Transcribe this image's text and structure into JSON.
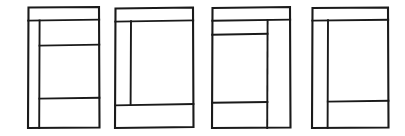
{
  "figure": {
    "title": "",
    "caption": "",
    "background_color": "#ffffff",
    "line_color": "#1a1a1a",
    "width": 405,
    "height": 136,
    "panel_count": 4
  },
  "panels": [
    {
      "id": "panel-1",
      "label": "",
      "x": 23,
      "width": 78,
      "outer": {
        "x": 4,
        "y": 7,
        "w": 72,
        "h": 121
      },
      "top_strip": {
        "y": 20,
        "label": "header-strip"
      },
      "vertical_dividers": [
        {
          "x": 16,
          "from_y": 20,
          "to_y": 128,
          "label": "left-column-divider"
        }
      ],
      "horizontal_dividers": [
        {
          "y": 45,
          "from_x": 16,
          "to_x": 76,
          "label": "right-column-line-1"
        },
        {
          "y": 98,
          "from_x": 16,
          "to_x": 76,
          "label": "right-column-line-2"
        }
      ],
      "region_count": 5
    },
    {
      "id": "panel-2",
      "label": "",
      "x": 108,
      "width": 92,
      "outer": {
        "x": 6,
        "y": 7,
        "w": 78,
        "h": 121
      },
      "top_strip": {
        "y": 21,
        "label": "header-strip"
      },
      "vertical_dividers": [
        {
          "x": 22,
          "from_y": 21,
          "to_y": 104,
          "label": "left-column-divider"
        }
      ],
      "horizontal_dividers": [
        {
          "y": 104,
          "from_x": 6,
          "to_x": 84,
          "label": "footer-line"
        }
      ],
      "region_count": 4
    },
    {
      "id": "panel-3",
      "label": "",
      "x": 205,
      "width": 92,
      "outer": {
        "x": 6,
        "y": 7,
        "w": 78,
        "h": 121
      },
      "top_strip": {
        "y": 20,
        "label": "header-strip"
      },
      "vertical_dividers": [
        {
          "x": 62,
          "from_y": 20,
          "to_y": 128,
          "label": "right-column-divider"
        }
      ],
      "horizontal_dividers": [
        {
          "y": 34,
          "from_x": 6,
          "to_x": 62,
          "label": "left-column-line-1"
        },
        {
          "y": 102,
          "from_x": 6,
          "to_x": 62,
          "label": "left-column-line-2"
        }
      ],
      "region_count": 5
    },
    {
      "id": "panel-4",
      "label": "",
      "x": 305,
      "width": 95,
      "outer": {
        "x": 6,
        "y": 7,
        "w": 76,
        "h": 121
      },
      "top_strip": {
        "y": 20,
        "label": "header-strip"
      },
      "vertical_dividers": [
        {
          "x": 22,
          "from_y": 20,
          "to_y": 128,
          "label": "left-column-divider"
        }
      ],
      "horizontal_dividers": [
        {
          "y": 101,
          "from_x": 22,
          "to_x": 82,
          "label": "right-column-line-1"
        }
      ],
      "region_count": 4
    }
  ]
}
